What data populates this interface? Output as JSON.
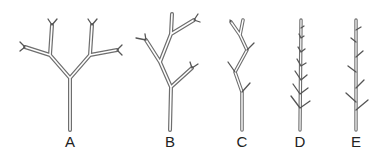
{
  "figure": {
    "stroke_color": "#6e6e6e",
    "background": "#ffffff"
  },
  "panels": [
    {
      "id": "A",
      "label": "A",
      "label_x": 70,
      "label_y": 134
    },
    {
      "id": "B",
      "label": "B",
      "label_x": 170,
      "label_y": 134
    },
    {
      "id": "C",
      "label": "C",
      "label_x": 242,
      "label_y": 134
    },
    {
      "id": "D",
      "label": "D",
      "label_x": 300,
      "label_y": 134
    },
    {
      "id": "E",
      "label": "E",
      "label_x": 356,
      "label_y": 134
    }
  ]
}
